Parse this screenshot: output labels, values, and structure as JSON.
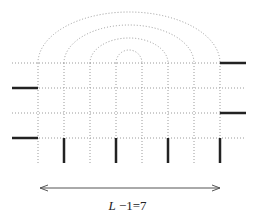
{
  "diagram": {
    "type": "lattice-arc-diagram",
    "label": {
      "var": "L",
      "rest": " −1=7"
    },
    "colors": {
      "dotted": "#9a9a9a",
      "thick": "#222222",
      "arrow": "#555555"
    },
    "grid": {
      "rows_y": [
        63,
        88,
        113,
        138
      ],
      "cols_x": [
        38,
        64,
        90,
        116,
        142,
        168,
        194,
        220
      ],
      "x_extent": [
        12,
        246
      ],
      "y_bottom": 163
    },
    "arcs": [
      {
        "x1": 38,
        "x2": 220,
        "top": 12
      },
      {
        "x1": 64,
        "x2": 194,
        "top": 25
      },
      {
        "x1": 90,
        "x2": 168,
        "top": 38
      },
      {
        "x1": 116,
        "x2": 142,
        "top": 50
      }
    ],
    "left_stubs_y": [
      88,
      138
    ],
    "right_stubs_y": [
      63,
      113
    ],
    "bottom_legs_x": [
      64,
      116,
      168,
      220
    ],
    "arrow": {
      "x1": 40,
      "x2": 220,
      "y": 188
    }
  }
}
